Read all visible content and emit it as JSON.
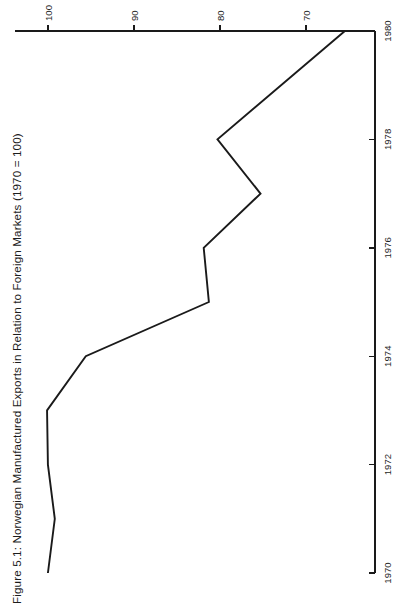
{
  "figure": {
    "title": "Figure 5.1:  Norwegian Manufactured Exports in Relation to Foreign Markets (1970 = 100)",
    "orientation": "rotated-90-ccw",
    "line_color": "#1a1a1a",
    "axis_color": "#1a1a1a",
    "background": "#ffffff"
  },
  "chart_data": {
    "type": "line",
    "title": "Figure 5.1:  Norwegian Manufactured Exports in Relation to Foreign Markets (1970 = 100)",
    "xlabel": "",
    "ylabel": "",
    "xlim": [
      1970,
      1980
    ],
    "ylim": [
      62,
      101.5
    ],
    "grid": false,
    "legend": null,
    "x_ticks": [
      1970,
      1972,
      1974,
      1976,
      1978,
      1980
    ],
    "x_tick_labels": [
      "1970",
      "1972",
      "1974",
      "1976",
      "1978",
      "1980"
    ],
    "y_ticks": [
      100,
      90,
      80,
      70
    ],
    "y_tick_labels": [
      "100",
      "90",
      "80",
      "70"
    ],
    "series": [
      {
        "name": "Norwegian manufactured exports relative to foreign markets",
        "x": [
          1970,
          1971,
          1972,
          1973,
          1974,
          1975,
          1976,
          1977,
          1978,
          1980
        ],
        "values": [
          100.0,
          99.2,
          100.0,
          100.1,
          95.6,
          81.3,
          81.9,
          75.3,
          80.3,
          65.5
        ]
      }
    ]
  }
}
